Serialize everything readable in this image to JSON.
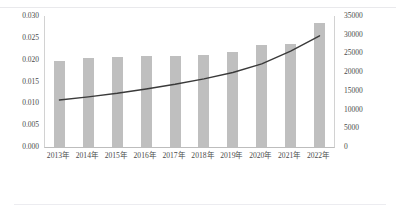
{
  "page": {
    "top_caption": "　　　　　　　　　　　　　　　　　　　　　　　　　　"
  },
  "chart_data": {
    "type": "bar",
    "title": "",
    "subtitle": "",
    "xlabel": "",
    "ylabel": "",
    "grid": false,
    "legend_position": "none",
    "categories": [
      "2013年",
      "2014年",
      "2015年",
      "2016年",
      "2017年",
      "2018年",
      "2019年",
      "2020年",
      "2021年",
      "2022年"
    ],
    "left_axis": {
      "ylim": [
        0.0,
        0.03
      ],
      "tick_step": 0.005,
      "tick_labels": [
        "0.030",
        "0.025",
        "0.020",
        "0.015",
        "0.010",
        "0.005",
        "0.000"
      ],
      "tick_values": [
        0.03,
        0.025,
        0.02,
        0.015,
        0.01,
        0.005,
        0.0
      ]
    },
    "right_axis": {
      "ylim": [
        0,
        35000
      ],
      "tick_step": 5000,
      "tick_labels": [
        "35000",
        "30000",
        "25000",
        "20000",
        "15000",
        "10000",
        "5000",
        "0"
      ],
      "tick_values": [
        35000,
        30000,
        25000,
        20000,
        15000,
        10000,
        5000,
        0
      ]
    },
    "series": [
      {
        "name": "bar-series",
        "type": "bar",
        "axis": "left",
        "color": "#bfbfbf",
        "values": [
          0.0196,
          0.0203,
          0.0207,
          0.0209,
          0.0209,
          0.0211,
          0.0217,
          0.0234,
          0.0237,
          0.0283
        ]
      },
      {
        "name": "line-series",
        "type": "line",
        "axis": "right",
        "color": "#3a3a3a",
        "values": [
          12550,
          13400,
          14350,
          15500,
          16750,
          18200,
          19900,
          22200,
          25600,
          29700
        ]
      }
    ]
  }
}
